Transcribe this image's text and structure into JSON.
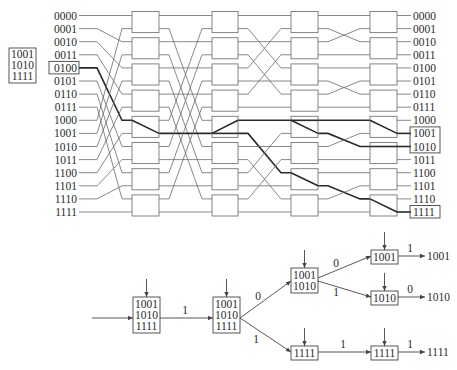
{
  "network": {
    "row_labels": [
      "0000",
      "0001",
      "0010",
      "0011",
      "0100",
      "0101",
      "0110",
      "0111",
      "1000",
      "1001",
      "1010",
      "1011",
      "1100",
      "1101",
      "1110",
      "1111"
    ],
    "source_label": "0100",
    "source_row": 4,
    "destination_set": [
      "1001",
      "1010",
      "1111"
    ],
    "highlighted_outputs": [
      "1001",
      "1010",
      "1111"
    ],
    "stages": 4,
    "switches_per_stage": 8,
    "gap_connections": [
      [
        0,
        2,
        4,
        6,
        8,
        10,
        12,
        14,
        1,
        3,
        5,
        7,
        9,
        11,
        13,
        15
      ],
      [
        0,
        8,
        2,
        10,
        4,
        12,
        6,
        14,
        1,
        9,
        3,
        11,
        5,
        13,
        7,
        15
      ],
      [
        0,
        4,
        2,
        6,
        1,
        5,
        3,
        7,
        8,
        12,
        10,
        14,
        9,
        13,
        11,
        15
      ],
      [
        0,
        2,
        1,
        3,
        4,
        6,
        5,
        7,
        8,
        10,
        9,
        11,
        12,
        14,
        13,
        15
      ]
    ],
    "thick_path": {
      "input": [
        [
          4,
          8
        ]
      ],
      "stage1": [
        [
          8,
          9
        ]
      ],
      "gap1": [
        [
          9,
          9
        ]
      ],
      "stage2": [
        [
          9,
          8
        ],
        [
          9,
          9
        ]
      ],
      "gap2": [
        [
          8,
          8
        ],
        [
          9,
          12
        ]
      ],
      "stage3": [
        [
          8,
          8
        ],
        [
          8,
          9
        ],
        [
          12,
          13
        ]
      ],
      "gap3": [
        [
          8,
          8
        ],
        [
          9,
          10
        ],
        [
          13,
          14
        ]
      ],
      "stage4": [
        [
          8,
          9
        ],
        [
          10,
          10
        ],
        [
          14,
          15
        ]
      ]
    }
  },
  "tree": {
    "root_box": [
      "1001",
      "1010",
      "1111"
    ],
    "level1_box": [
      "1001",
      "1010",
      "1111"
    ],
    "edge_root_to_l1": "1",
    "l2_upper_box": [
      "1001",
      "1010"
    ],
    "l2_lower_box": [
      "1111"
    ],
    "edge_l1_upper": "0",
    "edge_l1_lower": "1",
    "l3_box_1001": [
      "1001"
    ],
    "l3_box_1010": [
      "1010"
    ],
    "l3_box_1111": [
      "1111"
    ],
    "edge_to_1001": "0",
    "edge_to_1010": "1",
    "edge_to_l3_1111": "1",
    "out_1001_edge": "1",
    "out_1010_edge": "0",
    "out_1111_edge": "1",
    "out_1001": "1001",
    "out_1010": "1010",
    "out_1111": "1111"
  }
}
